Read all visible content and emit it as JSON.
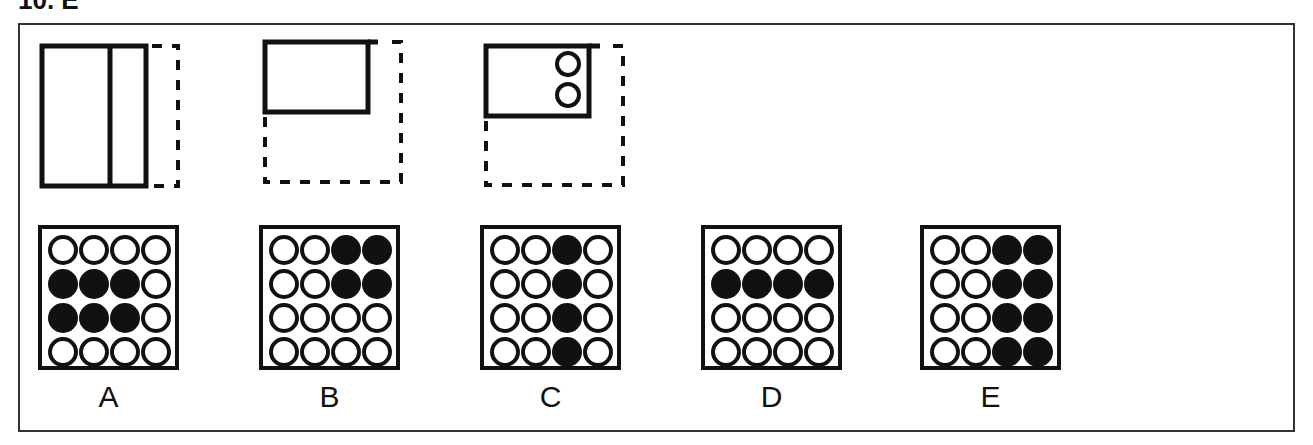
{
  "question": {
    "title": "10. E"
  },
  "folding_steps": [
    {
      "id": "step-1",
      "description": "paper folded vertically, right strip folded"
    },
    {
      "id": "step-2",
      "description": "paper folded horizontally to top-left quarter"
    },
    {
      "id": "step-3",
      "description": "two holes punched at right side of folded paper"
    }
  ],
  "options": [
    {
      "label": "A",
      "grid": [
        [
          0,
          0,
          0,
          0
        ],
        [
          1,
          1,
          1,
          0
        ],
        [
          1,
          1,
          1,
          0
        ],
        [
          0,
          0,
          0,
          0
        ]
      ]
    },
    {
      "label": "B",
      "grid": [
        [
          0,
          0,
          1,
          1
        ],
        [
          0,
          0,
          1,
          1
        ],
        [
          0,
          0,
          0,
          0
        ],
        [
          0,
          0,
          0,
          0
        ]
      ]
    },
    {
      "label": "C",
      "grid": [
        [
          0,
          0,
          1,
          0
        ],
        [
          0,
          0,
          1,
          0
        ],
        [
          0,
          0,
          1,
          0
        ],
        [
          0,
          0,
          1,
          0
        ]
      ]
    },
    {
      "label": "D",
      "grid": [
        [
          0,
          0,
          0,
          0
        ],
        [
          1,
          1,
          1,
          1
        ],
        [
          0,
          0,
          0,
          0
        ],
        [
          0,
          0,
          0,
          0
        ]
      ]
    },
    {
      "label": "E",
      "grid": [
        [
          0,
          0,
          1,
          1
        ],
        [
          0,
          0,
          1,
          1
        ],
        [
          0,
          0,
          1,
          1
        ],
        [
          0,
          0,
          1,
          1
        ]
      ]
    }
  ],
  "colors": {
    "ink": "#111111",
    "frame": "#333333",
    "background": "#ffffff"
  }
}
